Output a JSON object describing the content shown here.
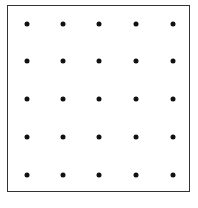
{
  "diagram": {
    "type": "dot-grid",
    "rows": 5,
    "cols": 5,
    "frame": {
      "left": 7,
      "top": 5,
      "right": 191,
      "bottom": 193
    },
    "dot_x": [
      27,
      63,
      99,
      136,
      173
    ],
    "dot_y": [
      24,
      61,
      99,
      137,
      175
    ],
    "dot_color": "#111111",
    "border_color": "#333333",
    "background_color": "#ffffff"
  }
}
